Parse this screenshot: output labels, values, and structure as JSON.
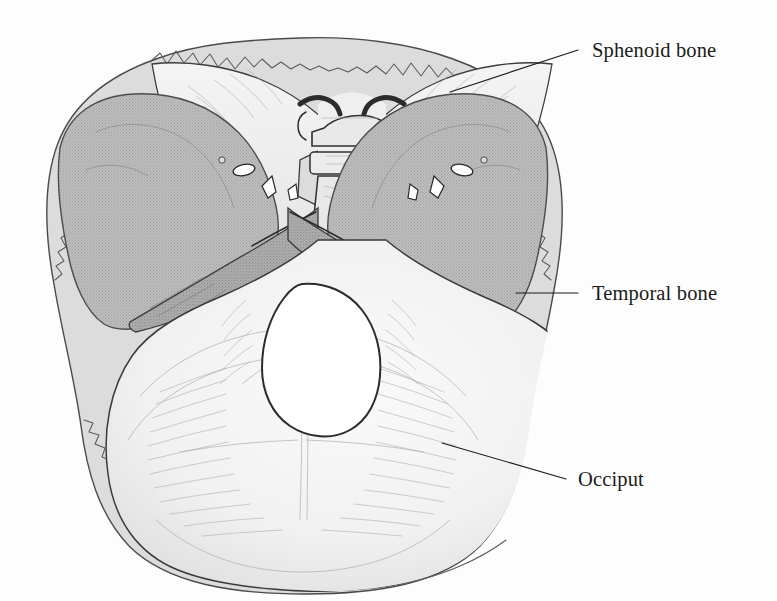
{
  "figure": {
    "kind": "anatomical-illustration",
    "background_color": "#fdfdfd",
    "ink_color": "#2b2b2b",
    "canvas": {
      "width": 777,
      "height": 601
    }
  },
  "labels": [
    {
      "id": "sphenoid",
      "text": "Sphenoid bone",
      "text_x": 592,
      "text_y": 57,
      "leader": {
        "x1": 450,
        "y1": 92,
        "x2": 578,
        "y2": 50
      }
    },
    {
      "id": "temporal",
      "text": "Temporal bone",
      "text_x": 592,
      "text_y": 300,
      "leader": {
        "x1": 516,
        "y1": 293,
        "x2": 578,
        "y2": 293
      }
    },
    {
      "id": "occiput",
      "text": "Occiput",
      "text_x": 578,
      "text_y": 486,
      "leader": {
        "x1": 442,
        "y1": 443,
        "x2": 566,
        "y2": 479
      }
    }
  ],
  "regions": [
    {
      "id": "outer-rim",
      "name": "Cut margin of cranial vault",
      "fill": "#dcdcdc"
    },
    {
      "id": "temporal-left",
      "name": "Left temporal bone",
      "fill": "#b6b6b6"
    },
    {
      "id": "temporal-right",
      "name": "Right temporal bone",
      "fill": "#b6b6b6"
    },
    {
      "id": "petrous-left",
      "name": "Left petrous ridge",
      "fill": "#a8a8a8"
    },
    {
      "id": "petrous-right",
      "name": "Right petrous ridge",
      "fill": "#a8a8a8"
    },
    {
      "id": "sphenoid-body",
      "name": "Sphenoid bone and wings",
      "fill": "#eeeeee"
    },
    {
      "id": "occipital-plate",
      "name": "Occipital bone",
      "fill": "#f2f2f2"
    },
    {
      "id": "foramen-magnum",
      "name": "Foramen magnum",
      "fill": "#ffffff"
    }
  ],
  "features": [
    {
      "id": "sella-turcica",
      "name": "Sella turcica (pituitary fossa)"
    },
    {
      "id": "anterior-clinoid",
      "name": "Anterior clinoid processes"
    },
    {
      "id": "posterior-clinoid",
      "name": "Posterior clinoid processes"
    },
    {
      "id": "clivus",
      "name": "Clivus"
    },
    {
      "id": "internal-acoustic-meatus",
      "name": "Internal acoustic meatus"
    },
    {
      "id": "jugular-foramen",
      "name": "Jugular foramen"
    },
    {
      "id": "lambdoid-suture",
      "name": "Serrated lambdoid suture margin"
    },
    {
      "id": "internal-occipital-crest",
      "name": "Internal occipital crest"
    }
  ]
}
